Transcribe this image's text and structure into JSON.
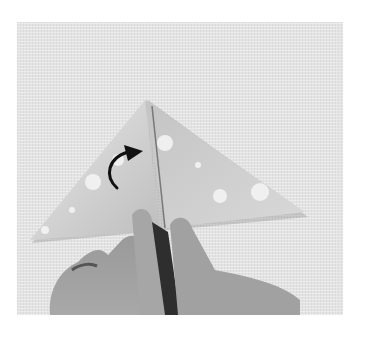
{
  "image": {
    "description": "Origami instruction photo: hands folding a triangular patterned paper, with a curved black arrow indicating fold direction",
    "background_color": "#e3e3e3",
    "paper_color": "#cfcfcf",
    "arrow_color": "#111111",
    "arrow_direction": "curved-up-right"
  }
}
